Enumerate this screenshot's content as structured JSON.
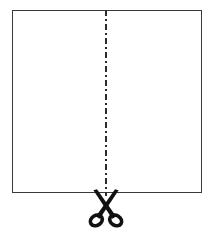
{
  "figure": {
    "type": "instructional-diagram",
    "background_color": "#ffffff",
    "canvas": {
      "width": 212,
      "height": 236
    }
  },
  "sheet": {
    "label": "paper-sheet",
    "x": 12,
    "y": 10,
    "width": 189,
    "height": 182,
    "stroke_color": "#3a3a3a",
    "stroke_width": 1,
    "fill_color": "#ffffff"
  },
  "cut_line": {
    "label": "cut-line",
    "orientation": "vertical",
    "x": 106,
    "y_start": 10,
    "y_end": 196,
    "pattern": "dash-dot",
    "dash_array": "6,3,2,3",
    "stroke_color": "#2b2b2b",
    "stroke_width": 2
  },
  "scissors": {
    "label": "scissors-icon",
    "center_x": 106,
    "top_y": 190,
    "bottom_y": 226,
    "width": 34,
    "height": 36,
    "color": "#111111",
    "glyph": "✂"
  },
  "colors": {
    "ink": "#111111",
    "outline": "#3a3a3a",
    "paper": "#ffffff"
  }
}
